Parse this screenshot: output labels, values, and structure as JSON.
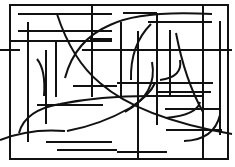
{
  "figure": {
    "title": "",
    "stroke_color": "#111111",
    "background": "#ffffff",
    "stroke_width": 2,
    "frame": {
      "x": 10,
      "y": 5,
      "w": 218,
      "h": 154
    },
    "lines": [
      {
        "x1": 203,
        "y1": 5,
        "x2": 203,
        "y2": 159
      },
      {
        "x1": 10,
        "y1": 41,
        "x2": 112,
        "y2": 41
      },
      {
        "x1": 18,
        "y1": 14,
        "x2": 112,
        "y2": 14
      },
      {
        "x1": 18,
        "y1": 31,
        "x2": 112,
        "y2": 31
      },
      {
        "x1": 123,
        "y1": 13,
        "x2": 157,
        "y2": 13
      },
      {
        "x1": 148,
        "y1": 22,
        "x2": 212,
        "y2": 22
      },
      {
        "x1": 82,
        "y1": 50,
        "x2": 232,
        "y2": 50
      },
      {
        "x1": 0,
        "y1": 50,
        "x2": 20,
        "y2": 50
      },
      {
        "x1": 90,
        "y1": 39,
        "x2": 112,
        "y2": 39
      },
      {
        "x1": 73,
        "y1": 86,
        "x2": 117,
        "y2": 86
      },
      {
        "x1": 37,
        "y1": 105,
        "x2": 103,
        "y2": 105
      },
      {
        "x1": 157,
        "y1": 92,
        "x2": 211,
        "y2": 92
      },
      {
        "x1": 74,
        "y1": 86,
        "x2": 117,
        "y2": 86
      },
      {
        "x1": 46,
        "y1": 142,
        "x2": 112,
        "y2": 142
      },
      {
        "x1": 57,
        "y1": 150,
        "x2": 117,
        "y2": 150
      },
      {
        "x1": 117,
        "y1": 83,
        "x2": 213,
        "y2": 83
      },
      {
        "x1": 147,
        "y1": 96,
        "x2": 203,
        "y2": 96
      },
      {
        "x1": 165,
        "y1": 109,
        "x2": 220,
        "y2": 109
      },
      {
        "x1": 117,
        "y1": 152,
        "x2": 167,
        "y2": 152
      },
      {
        "x1": 166,
        "y1": 130,
        "x2": 222,
        "y2": 130
      },
      {
        "x1": 28,
        "y1": 22,
        "x2": 28,
        "y2": 142
      },
      {
        "x1": 46,
        "y1": 50,
        "x2": 46,
        "y2": 124
      },
      {
        "x1": 56,
        "y1": 41,
        "x2": 56,
        "y2": 97
      },
      {
        "x1": 92,
        "y1": 5,
        "x2": 92,
        "y2": 97
      },
      {
        "x1": 121,
        "y1": 22,
        "x2": 121,
        "y2": 97
      },
      {
        "x1": 138,
        "y1": 31,
        "x2": 138,
        "y2": 159
      },
      {
        "x1": 157,
        "y1": 13,
        "x2": 157,
        "y2": 125
      },
      {
        "x1": 170,
        "y1": 30,
        "x2": 170,
        "y2": 97
      },
      {
        "x1": 220,
        "y1": 21,
        "x2": 220,
        "y2": 135
      }
    ],
    "curves": [
      {
        "d": "M 57 14 Q 72 60 100 83 Q 140 118 232 134"
      },
      {
        "d": "M 37 59 Q 46 70 44 96"
      },
      {
        "d": "M 65 78 Q 75 40 110 25 Q 140 10 212 14"
      },
      {
        "d": "M 151 24 Q 130 45 131 80"
      },
      {
        "d": "M 19 133 Q 25 110 60 104 Q 100 96 149 96"
      },
      {
        "d": "M 67 131 Q 100 125 130 108 Q 150 95 155 83"
      },
      {
        "d": "M 0 140 Q 30 128 65 131"
      },
      {
        "d": "M 176 33 Q 185 80 203 112"
      },
      {
        "d": "M 180 60 Q 183 77 160 80"
      },
      {
        "d": "M 200 102 Q 197 115 166 118"
      },
      {
        "d": "M 220 115 Q 214 140 184 141"
      },
      {
        "d": "M 152 62 Q 158 93 125 112"
      }
    ]
  }
}
